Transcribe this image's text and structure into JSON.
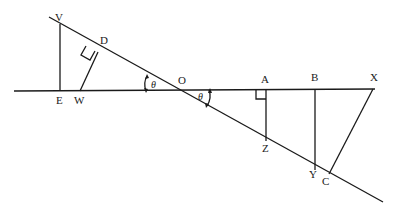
{
  "diagram": {
    "points": {
      "V": "V",
      "D": "D",
      "E": "E",
      "W": "W",
      "O": "O",
      "A": "A",
      "B": "B",
      "X": "X",
      "Z": "Z",
      "Y": "Y",
      "C": "C"
    },
    "angle_label": "θ",
    "segments": [
      "VE",
      "WD",
      "AZ",
      "BY",
      "XC"
    ],
    "right_angles": [
      "D",
      "A"
    ]
  }
}
